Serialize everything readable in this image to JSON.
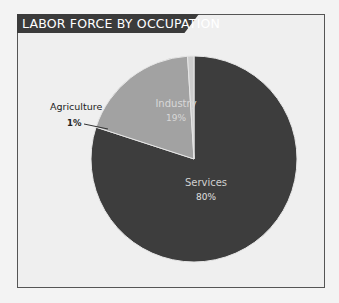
{
  "title": "LABOR FORCE BY OCCUPATION",
  "colors": {
    "services": "#3d3d3d",
    "industry": "#a2a2a2",
    "agriculture": "#cdcdcd",
    "background": "#efefef",
    "title_bar": "#3b3b3b"
  },
  "labels": {
    "industry_name": "Industry",
    "industry_value": "19%",
    "services_name": "Services",
    "services_value": "80%",
    "agriculture_name": "Agriculture",
    "agriculture_value": "1%"
  },
  "chart_data": {
    "type": "pie",
    "title": "LABOR FORCE BY OCCUPATION",
    "categories": [
      "Services",
      "Industry",
      "Agriculture"
    ],
    "values": [
      80,
      19,
      1
    ],
    "unit": "%",
    "start_angle": "12 o'clock, clockwise",
    "legend": "none (inline labels)"
  }
}
